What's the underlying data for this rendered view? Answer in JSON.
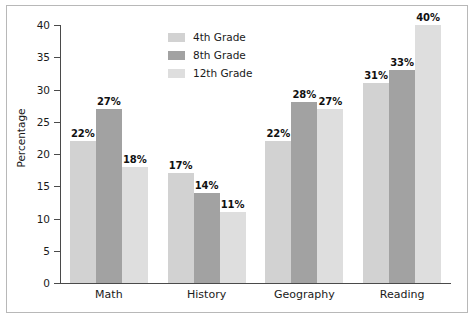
{
  "chart_data": {
    "type": "bar",
    "title": "",
    "subtitle": "",
    "xlabel": "",
    "ylabel": "Percentage",
    "categories": [
      "Math",
      "History",
      "Geography",
      "Reading"
    ],
    "series": [
      {
        "name": "4th Grade",
        "color": "#d2d2d2",
        "values": [
          22,
          17,
          22,
          31
        ],
        "labels": [
          "22%",
          "17%",
          "22%",
          "31%"
        ]
      },
      {
        "name": "8th Grade",
        "color": "#a2a2a2",
        "values": [
          27,
          14,
          28,
          33
        ],
        "labels": [
          "27%",
          "14%",
          "28%",
          "33%"
        ]
      },
      {
        "name": "12th Grade",
        "color": "#dedede",
        "values": [
          18,
          11,
          27,
          40
        ],
        "labels": [
          "18%",
          "11%",
          "27%",
          "40%"
        ]
      }
    ],
    "ylim": [
      0,
      40
    ],
    "y_ticks": [
      0,
      5,
      10,
      15,
      20,
      25,
      30,
      35,
      40
    ],
    "y_tick_labels": [
      "0",
      "5",
      "10",
      "15",
      "20",
      "25",
      "30",
      "35",
      "40"
    ],
    "grid": false,
    "legend_position": "top-center",
    "value_suffix": "%"
  },
  "legend": {
    "items": [
      {
        "label": "4th Grade",
        "color": "#d2d2d2"
      },
      {
        "label": "8th Grade",
        "color": "#a2a2a2"
      },
      {
        "label": "12th Grade",
        "color": "#dedede"
      }
    ]
  },
  "axes": {
    "y_title": "Percentage",
    "x_categories": [
      "Math",
      "History",
      "Geography",
      "Reading"
    ],
    "y_tick_labels": [
      "0",
      "5",
      "10",
      "15",
      "20",
      "25",
      "30",
      "35",
      "40"
    ]
  }
}
